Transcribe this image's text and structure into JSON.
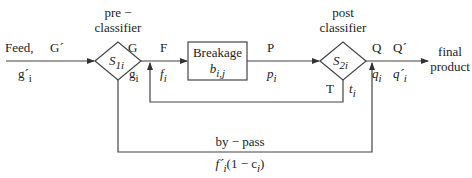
{
  "diagram": {
    "type": "process-flow",
    "nodes": [
      {
        "id": "pre_classifier",
        "shape": "diamond",
        "label": "S",
        "subscript": "1i",
        "title_line1": "pre −",
        "title_line2": "classifier"
      },
      {
        "id": "breakage",
        "shape": "rectangle",
        "label": "Breakage",
        "sublabel": "b",
        "sublabel_sub": "i,j"
      },
      {
        "id": "post_classifier",
        "shape": "diamond",
        "label": "S",
        "subscript": "2i",
        "title_line1": "post",
        "title_line2": "classifier"
      }
    ],
    "streams": {
      "feed": {
        "name": "Feed,",
        "symbol": "G´",
        "comp": "g´",
        "comp_sub": "i"
      },
      "g": {
        "symbol": "G",
        "comp": "g",
        "comp_sub": "i"
      },
      "f": {
        "symbol": "F",
        "comp": "f",
        "comp_sub": "i"
      },
      "p": {
        "symbol": "P",
        "comp": "p",
        "comp_sub": "i"
      },
      "q": {
        "symbol": "Q",
        "comp": "q",
        "comp_sub": "i"
      },
      "qprime": {
        "symbol": "Q´",
        "comp": "q´",
        "comp_sub": "i"
      },
      "t": {
        "symbol": "T",
        "comp": "t",
        "comp_sub": "i"
      },
      "bypass": {
        "name": "by − pass",
        "formula_pre": "f´",
        "formula_sub": "i",
        "formula_post": "(1 − c",
        "formula_sub2": "i",
        "formula_end": ")"
      }
    },
    "output": {
      "line1": "final",
      "line2": "product"
    }
  },
  "colors": {
    "line": "#444444",
    "text": "#222222"
  }
}
